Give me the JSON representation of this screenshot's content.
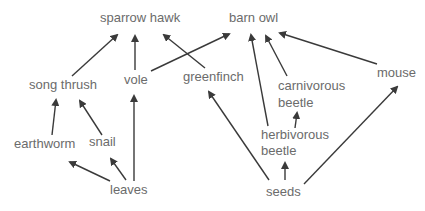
{
  "diagram": {
    "type": "food-web",
    "text_color": "#6b6b6b",
    "arrow_color": "#3a3a3a",
    "nodes": {
      "sparrow_hawk": "sparrow hawk",
      "barn_owl": "barn owl",
      "song_thrush": "song thrush",
      "vole": "vole",
      "greenfinch": "greenfinch",
      "carnivorous_beetle_1": "carnivorous",
      "carnivorous_beetle_2": "beetle",
      "mouse": "mouse",
      "earthworm": "earthworm",
      "snail": "snail",
      "herbivorous_beetle_1": "herbivorous",
      "herbivorous_beetle_2": "beetle",
      "leaves": "leaves",
      "seeds": "seeds"
    },
    "edges": [
      {
        "from": "song thrush",
        "to": "sparrow hawk"
      },
      {
        "from": "vole",
        "to": "sparrow hawk"
      },
      {
        "from": "greenfinch",
        "to": "sparrow hawk"
      },
      {
        "from": "vole",
        "to": "barn owl"
      },
      {
        "from": "herbivorous beetle",
        "to": "barn owl"
      },
      {
        "from": "carnivorous beetle",
        "to": "barn owl"
      },
      {
        "from": "mouse",
        "to": "barn owl"
      },
      {
        "from": "earthworm",
        "to": "song thrush"
      },
      {
        "from": "snail",
        "to": "song thrush"
      },
      {
        "from": "leaves",
        "to": "earthworm"
      },
      {
        "from": "leaves",
        "to": "snail"
      },
      {
        "from": "leaves",
        "to": "vole"
      },
      {
        "from": "seeds",
        "to": "greenfinch"
      },
      {
        "from": "seeds",
        "to": "herbivorous beetle"
      },
      {
        "from": "seeds",
        "to": "mouse"
      },
      {
        "from": "herbivorous beetle",
        "to": "carnivorous beetle"
      }
    ]
  }
}
